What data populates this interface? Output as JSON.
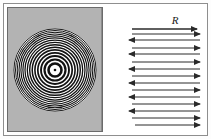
{
  "figure": {
    "background_color": "#fdfdfd",
    "frame_color": "#8e8e8e"
  },
  "left_panel": {
    "name": "interference-ring-pattern",
    "description": "Concentric black and white rings (Newton's rings / Fabry-Perot fringe pattern) on a gray plate",
    "plate_color": "#b3b3b3",
    "ring_color": "#121212",
    "gap_color": "#ffffff",
    "center_dot_color": "#121212",
    "center": {
      "cx": 43,
      "cy": 43
    },
    "center_dot_radius": 1.3,
    "rings": [
      {
        "r": 6.5,
        "stroke": 2.6
      },
      {
        "r": 10.5,
        "stroke": 2.2
      },
      {
        "r": 14.0,
        "stroke": 1.9
      },
      {
        "r": 17.2,
        "stroke": 1.7
      },
      {
        "r": 20.1,
        "stroke": 1.6
      },
      {
        "r": 22.8,
        "stroke": 1.5
      },
      {
        "r": 25.3,
        "stroke": 1.4
      },
      {
        "r": 27.7,
        "stroke": 1.3
      },
      {
        "r": 30.0,
        "stroke": 1.25
      },
      {
        "r": 32.1,
        "stroke": 1.2
      },
      {
        "r": 34.1,
        "stroke": 1.15
      },
      {
        "r": 36.0,
        "stroke": 1.1
      },
      {
        "r": 37.8,
        "stroke": 1.05
      },
      {
        "r": 39.5,
        "stroke": 1.0
      },
      {
        "r": 41.1,
        "stroke": 0.95
      }
    ]
  },
  "right_panel": {
    "name": "multiple-reflection-ray-diagram",
    "description": "Stack of alternating rightward and leftward horizontal arrows representing successive reflections",
    "background_color": "#ffffff",
    "arrow_color": "#2a2a2a",
    "label": {
      "text": "R",
      "x": 70,
      "y": 17
    },
    "arrows": [
      {
        "index": 1,
        "direction": "right",
        "y": 22,
        "x1": 27,
        "x2": 92,
        "weight": 1.6
      },
      {
        "index": 2,
        "direction": "right",
        "y": 27,
        "x1": 27,
        "x2": 95,
        "weight": 1.0
      },
      {
        "index": 3,
        "direction": "left",
        "y": 33,
        "x1": 95,
        "x2": 24,
        "weight": 1.0
      },
      {
        "index": 4,
        "direction": "right",
        "y": 41,
        "x1": 27,
        "x2": 95,
        "weight": 1.0
      },
      {
        "index": 5,
        "direction": "left",
        "y": 47,
        "x1": 95,
        "x2": 24,
        "weight": 1.0
      },
      {
        "index": 6,
        "direction": "right",
        "y": 55,
        "x1": 27,
        "x2": 95,
        "weight": 1.0
      },
      {
        "index": 7,
        "direction": "left",
        "y": 62,
        "x1": 95,
        "x2": 24,
        "weight": 1.0
      },
      {
        "index": 8,
        "direction": "right",
        "y": 69,
        "x1": 27,
        "x2": 95,
        "weight": 1.0
      },
      {
        "index": 9,
        "direction": "left",
        "y": 76,
        "x1": 95,
        "x2": 24,
        "weight": 1.0
      },
      {
        "index": 10,
        "direction": "right",
        "y": 83,
        "x1": 27,
        "x2": 95,
        "weight": 1.0
      },
      {
        "index": 11,
        "direction": "left",
        "y": 90,
        "x1": 95,
        "x2": 24,
        "weight": 1.0
      },
      {
        "index": 12,
        "direction": "right",
        "y": 97,
        "x1": 27,
        "x2": 95,
        "weight": 1.0
      },
      {
        "index": 13,
        "direction": "left",
        "y": 104,
        "x1": 95,
        "x2": 24,
        "weight": 1.0
      },
      {
        "index": 14,
        "direction": "right",
        "y": 111,
        "x1": 27,
        "x2": 95,
        "weight": 1.0
      },
      {
        "index": 15,
        "direction": "right",
        "y": 118,
        "x1": 30,
        "x2": 95,
        "weight": 1.0
      }
    ]
  }
}
